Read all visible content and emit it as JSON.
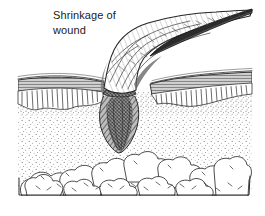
{
  "figure": {
    "kind": "medical-line-illustration",
    "caption": {
      "line1": "Shrinkage of",
      "line2": "wound",
      "full": "Shrinkage of\nwound"
    },
    "palette": {
      "background": "#ffffff",
      "ink": "#1b1b1b",
      "ink_soft": "#4a4a4a",
      "stipple": "#8d8d8d",
      "scar_dark": "#5b5b5b",
      "scar_darker": "#3a3a3a",
      "hatch": "#444444"
    },
    "layers": [
      {
        "name": "epidermis",
        "label": "epidermis",
        "y_top": 74,
        "y_bottom": 96
      },
      {
        "name": "dermis",
        "label": "dermis",
        "y_top": 96,
        "y_bottom": 150
      },
      {
        "name": "subcutaneous-fat",
        "label": "subcutaneous fat",
        "y_top": 148,
        "y_bottom": 196
      }
    ],
    "features": [
      {
        "name": "raised-wound-flap",
        "label": "raised puckered flap of shrinking wound"
      },
      {
        "name": "scar-cone",
        "label": "wedge of contracting scar tissue"
      },
      {
        "name": "flap-tip",
        "label": "tapering tip of elevated wound edge"
      }
    ]
  }
}
